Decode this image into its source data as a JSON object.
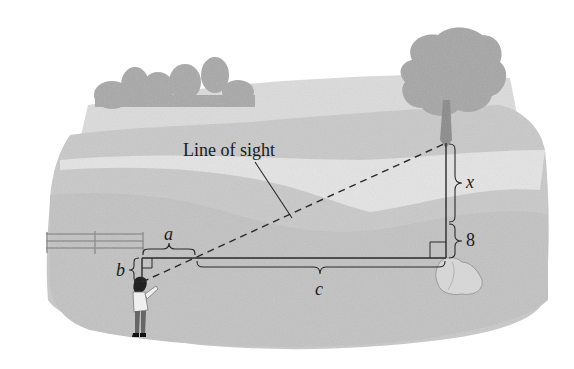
{
  "diagram": {
    "type": "indirect-measurement-similar-triangles",
    "labels": {
      "line_of_sight": "Line of sight",
      "a": "a",
      "b": "b",
      "c": "c",
      "x": "x",
      "eight": "8"
    },
    "elements": [
      "person",
      "tree",
      "rock",
      "fence",
      "distant-trees",
      "landscape"
    ],
    "colors": {
      "line": "#2a2a2a",
      "sky": "#ffffff",
      "hill_light": "#d9d9d9",
      "hill_mid": "#c4c4c4",
      "ground": "#cfcfcf",
      "foliage": "#a9a9a9"
    }
  }
}
